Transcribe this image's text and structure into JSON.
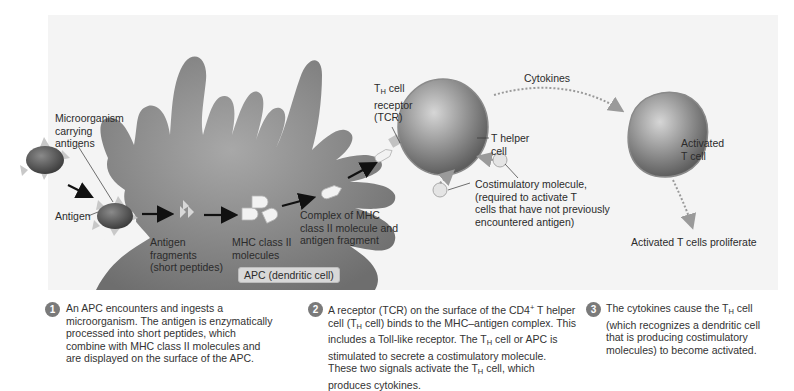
{
  "figure": {
    "labels": {
      "microorganism": [
        "Microorganism",
        "carrying",
        "antigens"
      ],
      "antigen": "Antigen",
      "antigen_fragments": [
        "Antigen",
        "fragments",
        "(short peptides)"
      ],
      "mhc_molecules": [
        "MHC class II",
        "molecules"
      ],
      "complex": [
        "Complex of MHC",
        "class II molecule and",
        "antigen fragment"
      ],
      "apc": "APC (dendritic cell)",
      "tcr": {
        "prefix": "T",
        "sub": "H",
        "suffix": " cell",
        "line2": "receptor",
        "line3": "(TCR)"
      },
      "t_helper": [
        "T helper",
        "cell"
      ],
      "cytokines": "Cytokines",
      "costimulatory": [
        "Costimulatory molecule,",
        "(required to activate T",
        "cells that have not previously",
        "encountered antigen)"
      ],
      "activated_t_cell": [
        "Activated",
        "T cell"
      ],
      "proliferate": "Activated T cells proliferate"
    },
    "colors": {
      "panel_bg": "#f4f4f4",
      "apc_cell": "#8a8a8a",
      "microbe": "#5a5a5a",
      "t_cell": "#8c8c8c",
      "step_badge": "#7a7a7a",
      "arrow": "#111111",
      "dotted_arrow": "#9a9a9a"
    }
  },
  "steps": [
    {
      "number": "1",
      "text": "An APC encounters and ingests a microorganism. The antigen is enzymatically processed into short peptides, which combine with MHC class II molecules and are displayed on the surface of the APC."
    },
    {
      "number": "2",
      "parts": {
        "a": "A receptor (TCR) on the surface of the CD4",
        "a_sup": "+",
        "b": " T helper cell (T",
        "b_sub": "H",
        "c": " cell) binds to the MHC–antigen complex. This includes a Toll-like receptor. The T",
        "c_sub": "H",
        "d": " cell or APC is stimulated to secrete a costimulatory molecule. These two signals activate the T",
        "d_sub": "H",
        "e": " cell, which produces cytokines."
      }
    },
    {
      "number": "3",
      "parts": {
        "a": "The cytokines cause the T",
        "a_sub": "H",
        "b": " cell (which recognizes a dendritic cell that is producing costimulatory molecules) to become activated."
      }
    }
  ]
}
